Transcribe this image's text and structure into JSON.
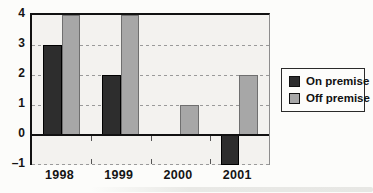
{
  "chart_data": {
    "type": "bar",
    "categories": [
      "1998",
      "1999",
      "2000",
      "2001"
    ],
    "series": [
      {
        "name": "On premise",
        "values": [
          3,
          2,
          0,
          -1
        ],
        "color": "#2d2d2d",
        "border_color": "#000000"
      },
      {
        "name": "Off premise",
        "values": [
          4,
          4,
          1,
          2
        ],
        "color": "#a7a7a7",
        "border_color": "#6f6f6f"
      }
    ],
    "title": "",
    "xlabel": "",
    "ylabel": "",
    "ylim": [
      -1,
      4
    ],
    "yticks": [
      4,
      3,
      2,
      1,
      0,
      -1
    ],
    "grid": "horizontal dashed at 1, 2, 3 and -1; solid black baseline at 0; solid top border at 4",
    "legend_position": "right"
  },
  "colors": {
    "plot_background": "#f3f2ef",
    "page_background": "#fcfcfa",
    "axis_line": "#111111",
    "gridline": "#9a9a9a",
    "legend_border": "#2a2a2a",
    "legend_background": "#fdfdfb"
  }
}
